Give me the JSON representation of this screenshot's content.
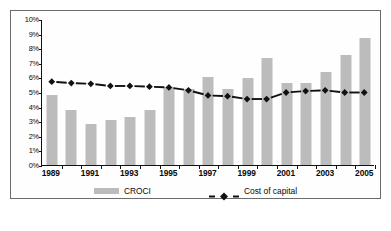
{
  "chart_data": {
    "type": "bar",
    "title": "",
    "xlabel": "",
    "ylabel": "",
    "ylim": [
      0,
      10
    ],
    "grid": false,
    "legend_position": "bottom",
    "categories": [
      "1989",
      "1990",
      "1991",
      "1992",
      "1993",
      "1994",
      "1995",
      "1996",
      "1997",
      "1998",
      "1999",
      "2000",
      "2001",
      "2002",
      "2003",
      "2004",
      "2005"
    ],
    "x_tick_labels": [
      "1989",
      "1991",
      "1993",
      "1995",
      "1997",
      "1999",
      "2001",
      "2003",
      "2005"
    ],
    "y_tick_labels": [
      "10%",
      "9%",
      "8%",
      "7%",
      "6%",
      "5%",
      "4%",
      "3%",
      "2%",
      "1%",
      "0%"
    ],
    "y_tick_values": [
      10,
      9,
      8,
      7,
      6,
      5,
      4,
      3,
      2,
      1,
      0
    ],
    "series": [
      {
        "name": "CROCI",
        "type": "bar",
        "color": "#bcbcbc",
        "values": [
          4.8,
          3.8,
          2.8,
          3.05,
          3.3,
          3.75,
          5.35,
          5.2,
          6.0,
          5.2,
          5.95,
          7.3,
          5.65,
          5.6,
          6.35,
          7.55,
          8.7
        ]
      },
      {
        "name": "Cost of capital",
        "type": "line",
        "color": "#111111",
        "marker": "diamond",
        "linestyle": "dashed",
        "values": [
          5.75,
          5.65,
          5.6,
          5.45,
          5.45,
          5.4,
          5.35,
          5.15,
          4.8,
          4.75,
          4.55,
          4.55,
          5.0,
          5.1,
          5.15,
          5.0,
          5.0
        ]
      }
    ]
  },
  "legend": {
    "croci_label": "CROCI",
    "cost_of_capital_label": "Cost of capital"
  },
  "caption": {
    "text": ""
  },
  "colors": {
    "bar_fill": "#bcbcbc",
    "line": "#111111",
    "axis": "#111111",
    "frame": "#6b6b6b"
  }
}
